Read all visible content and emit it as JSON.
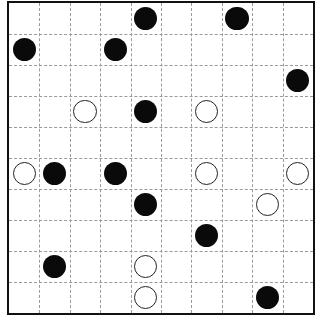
{
  "puzzle": {
    "type": "masyu",
    "rows": 10,
    "cols": 10,
    "colors": {
      "black": "#0a0a0a",
      "white": "#ffffff",
      "grid_line": "#9a9a9a",
      "border": "#111111"
    },
    "circles": [
      {
        "row": 0,
        "col": 4,
        "color": "black"
      },
      {
        "row": 0,
        "col": 7,
        "color": "black"
      },
      {
        "row": 1,
        "col": 0,
        "color": "black"
      },
      {
        "row": 1,
        "col": 3,
        "color": "black"
      },
      {
        "row": 2,
        "col": 9,
        "color": "black"
      },
      {
        "row": 3,
        "col": 2,
        "color": "white"
      },
      {
        "row": 3,
        "col": 4,
        "color": "black"
      },
      {
        "row": 3,
        "col": 6,
        "color": "white"
      },
      {
        "row": 5,
        "col": 0,
        "color": "white"
      },
      {
        "row": 5,
        "col": 1,
        "color": "black"
      },
      {
        "row": 5,
        "col": 3,
        "color": "black"
      },
      {
        "row": 5,
        "col": 6,
        "color": "white"
      },
      {
        "row": 5,
        "col": 9,
        "color": "white"
      },
      {
        "row": 6,
        "col": 4,
        "color": "black"
      },
      {
        "row": 6,
        "col": 8,
        "color": "white"
      },
      {
        "row": 7,
        "col": 6,
        "color": "black"
      },
      {
        "row": 8,
        "col": 1,
        "color": "black"
      },
      {
        "row": 8,
        "col": 4,
        "color": "white"
      },
      {
        "row": 9,
        "col": 4,
        "color": "white"
      },
      {
        "row": 9,
        "col": 8,
        "color": "black"
      }
    ]
  }
}
